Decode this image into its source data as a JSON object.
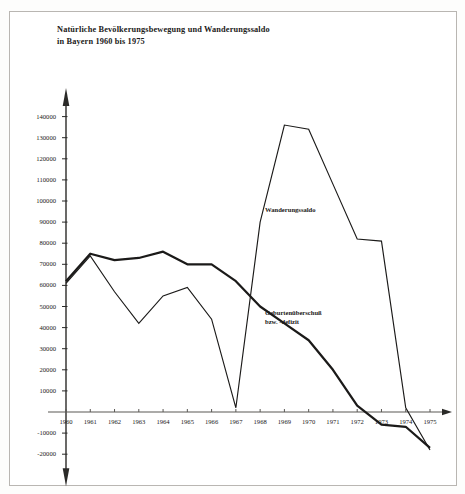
{
  "title": {
    "line1": "Natürliche Bevölkerungsbewegung und Wanderungssaldo",
    "line2": "in Bayern 1960 bis 1975"
  },
  "labels": {
    "wanderungssaldo": "Wanderungssaldo",
    "geburten_line1": "Geburtenüberschuß",
    "geburten_line2": "bzw. -defizit"
  },
  "colors": {
    "ink": "#1b1a19",
    "axis": "#2b2a28",
    "frame": "#b9b6b2",
    "paper": "#ffffff"
  },
  "chart_data": {
    "type": "line",
    "title": "Natürliche Bevölkerungsbewegung und Wanderungssaldo in Bayern 1960 bis 1975",
    "xlabel": "",
    "ylabel": "",
    "categories": [
      1960,
      1961,
      1962,
      1963,
      1964,
      1965,
      1966,
      1967,
      1968,
      1969,
      1970,
      1971,
      1972,
      1973,
      1974,
      1975
    ],
    "x_tick_labels": [
      "1960",
      "1961",
      "1962",
      "1963",
      "1964",
      "1965",
      "1966",
      "1967",
      "1968",
      "1969",
      "1970",
      "1971",
      "1972",
      "1973",
      "1974",
      "1975"
    ],
    "y_tick_labels": [
      "140000",
      "130000",
      "120000",
      "110000",
      "100000",
      "90000",
      "80000",
      "70000",
      "60000",
      "50000",
      "40000",
      "30000",
      "20000",
      "10000",
      "",
      "-10000",
      "-20000"
    ],
    "y_ticks": [
      140000,
      130000,
      120000,
      110000,
      100000,
      90000,
      80000,
      70000,
      60000,
      50000,
      40000,
      30000,
      20000,
      10000,
      0,
      -10000,
      -20000
    ],
    "ylim": [
      -20000,
      145000
    ],
    "xlim": [
      1960,
      1975
    ],
    "grid": false,
    "legend": "inline-annotations",
    "series": [
      {
        "name": "Geburtenüberschuß bzw. -defizit",
        "style": "thick",
        "values": [
          62000,
          75000,
          72000,
          73000,
          76000,
          70000,
          70000,
          62000,
          50000,
          42000,
          34000,
          20000,
          3000,
          -6000,
          -7000,
          -17000
        ]
      },
      {
        "name": "Wanderungssaldo",
        "style": "thin",
        "values": [
          61000,
          74000,
          57000,
          42000,
          55000,
          59000,
          44000,
          2000,
          90000,
          136000,
          134000,
          108000,
          82000,
          81000,
          2000,
          -18000
        ]
      }
    ],
    "annotations": [
      {
        "text": "Wanderungssaldo",
        "near_year": 1968,
        "near_value": 79000
      },
      {
        "text": "Geburtenüberschuß bzw. -defizit",
        "near_year": 1968,
        "near_value": 29000
      }
    ]
  }
}
